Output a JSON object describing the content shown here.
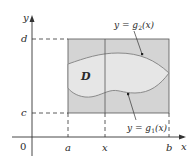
{
  "figure": {
    "axes": {
      "x_label": "x",
      "y_label": "y",
      "origin_label": "0"
    },
    "x_ticks": [
      {
        "label": "a",
        "x": 68
      },
      {
        "label": "x",
        "x": 105
      },
      {
        "label": "b",
        "x": 169
      }
    ],
    "y_ticks": [
      {
        "label": "d",
        "y": 39
      },
      {
        "label": "c",
        "y": 113
      }
    ],
    "region_label": "D",
    "curves": {
      "upper": "y = g₂(x)",
      "lower": "y = g₁(x)"
    },
    "upper_label": {
      "prefix": "y = ",
      "func": "g",
      "sub": "2",
      "arg": "(x)"
    },
    "lower_label": {
      "prefix": "y = ",
      "func": "g",
      "sub": "1",
      "arg": "(x)"
    },
    "colors": {
      "rectangle_fill": "#d4d4d4",
      "region_fill": "#e6e6e6",
      "curve_stroke": "#8a8a8a",
      "axis_stroke": "#333333"
    }
  }
}
